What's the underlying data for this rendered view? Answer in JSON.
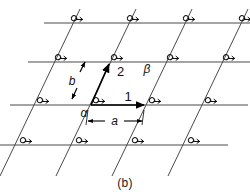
{
  "figure": {
    "caption": "(b)",
    "type": "oblique-2d-lattice-diagram",
    "background_color": "#ffffff",
    "line_color": "#4a4a4a",
    "vector_color": "#000000",
    "text_color": "#111111"
  },
  "labels": {
    "vector_1": "1",
    "vector_2": "2",
    "vector_a": "a",
    "vector_b": "b",
    "dimension_a": "a",
    "angle_alpha": "α",
    "angle_beta": "β"
  },
  "lattice": {
    "horizontal_rows": 4,
    "oblique_columns": 5,
    "node_angle_symbol": "α",
    "node_symbol_count": 16,
    "horizontal_line_y": [
      23,
      62,
      105,
      145
    ],
    "oblique_line_top_x": [
      77,
      133,
      189,
      245
    ],
    "oblique_slope_dx_per_dy": -0.42
  },
  "nodes": [
    {
      "x": 68,
      "y": 23,
      "symbol": "α"
    },
    {
      "x": 124,
      "y": 23,
      "symbol": "α"
    },
    {
      "x": 180,
      "y": 23,
      "symbol": "α"
    },
    {
      "x": 236,
      "y": 23,
      "symbol": "α"
    },
    {
      "x": 52,
      "y": 62,
      "symbol": "α"
    },
    {
      "x": 108,
      "y": 62,
      "symbol": "α"
    },
    {
      "x": 164,
      "y": 62,
      "symbol": "α"
    },
    {
      "x": 220,
      "y": 62,
      "symbol": "α"
    },
    {
      "x": 34,
      "y": 105,
      "symbol": "α"
    },
    {
      "x": 90,
      "y": 105,
      "symbol": "α"
    },
    {
      "x": 146,
      "y": 105,
      "symbol": "α"
    },
    {
      "x": 202,
      "y": 105,
      "symbol": "α"
    },
    {
      "x": 17,
      "y": 145,
      "symbol": "α"
    },
    {
      "x": 73,
      "y": 145,
      "symbol": "α"
    },
    {
      "x": 129,
      "y": 145,
      "symbol": "α"
    },
    {
      "x": 185,
      "y": 145,
      "symbol": "α"
    }
  ],
  "vectors": [
    {
      "name": "1",
      "label": "1",
      "from": [
        90,
        105
      ],
      "to": [
        146,
        105
      ],
      "orientation": "horizontal"
    },
    {
      "name": "2",
      "label": "2",
      "from": [
        90,
        105
      ],
      "to": [
        108,
        62
      ],
      "orientation": "oblique"
    }
  ],
  "dimension": {
    "label": "a",
    "from_x": 90,
    "to_x": 146,
    "y": 121,
    "style": "double-headed-arrow"
  }
}
